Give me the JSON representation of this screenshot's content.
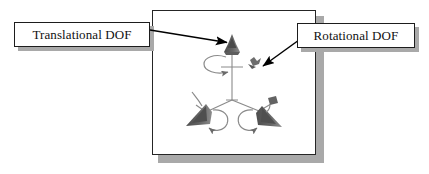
{
  "figure": {
    "type": "technical-diagram",
    "colors": {
      "background": "#ffffff",
      "frame_border": "#252525",
      "drop_shadow": "#a9a9a9",
      "callout_border": "#1d1d1d",
      "text": "#111111",
      "arrow": "#000000",
      "joint_dark": "#5a5a5a",
      "joint_outline": "#707070",
      "linkage_line": "#8a8a8a"
    }
  },
  "callouts": [
    {
      "id": "translational",
      "label": "Translational DOF",
      "points_to": "upper joint"
    },
    {
      "id": "rotational",
      "label": "Rotational DOF",
      "points_to": "upper rotation symbol"
    }
  ],
  "mechanism": {
    "hub": {
      "x": 232,
      "y": 100
    },
    "joints": [
      {
        "id": "joint-top",
        "x": 232,
        "y": 46
      },
      {
        "id": "joint-lower-left",
        "x": 196,
        "y": 120
      },
      {
        "id": "joint-lower-right",
        "x": 272,
        "y": 118
      }
    ],
    "rotation_symbols": [
      {
        "id": "rotation-top",
        "x": 214,
        "y": 62
      },
      {
        "id": "rotation-side",
        "x": 254,
        "y": 62
      },
      {
        "id": "rotation-lower-left",
        "x": 218,
        "y": 122
      },
      {
        "id": "rotation-lower-right",
        "x": 248,
        "y": 122
      }
    ]
  }
}
